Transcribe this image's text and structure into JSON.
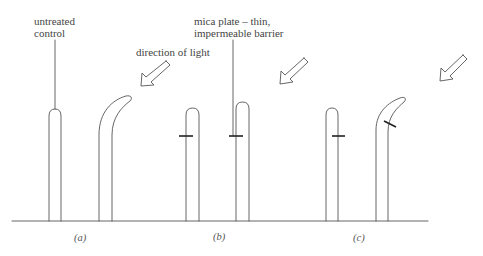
{
  "diagram": {
    "labels": {
      "untreated_control_line1": "untreated",
      "untreated_control_line2": "control",
      "direction_of_light": "direction of light",
      "mica_plate_line1": "mica plate – thin,",
      "mica_plate_line2": "impermeable barrier"
    },
    "panels": [
      {
        "id": "a",
        "caption": "(a)",
        "description": "Untreated control grows straight; untreated shoot bends toward light"
      },
      {
        "id": "b",
        "caption": "(b)",
        "description": "Mica plate inserted horizontally on both shoots; neither bends"
      },
      {
        "id": "c",
        "caption": "(c)",
        "description": "Mica plate on shaded side below tip; shoot bends toward light"
      }
    ],
    "light_arrows": [
      {
        "panel": "a",
        "direction": "down-left"
      },
      {
        "panel": "b",
        "direction": "down-left"
      },
      {
        "panel": "c",
        "direction": "down-left"
      }
    ],
    "colors": {
      "line": "#555555",
      "mica_plate": "#222222",
      "text": "#444444"
    }
  }
}
